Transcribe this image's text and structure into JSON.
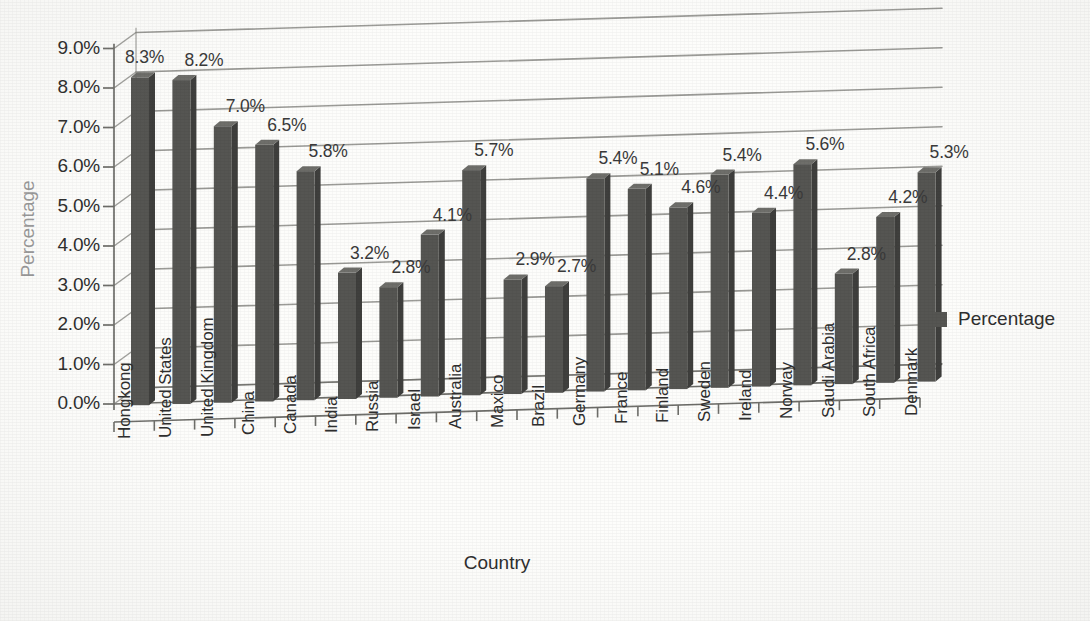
{
  "chart_data": {
    "type": "bar",
    "title": "",
    "xlabel": "Country",
    "ylabel": "Percentage",
    "ylim": [
      0,
      9
    ],
    "ytick_labels": [
      "0.0%",
      "1.0%",
      "2.0%",
      "3.0%",
      "4.0%",
      "5.0%",
      "6.0%",
      "7.0%",
      "8.0%",
      "9.0%"
    ],
    "ytick_values": [
      0,
      1,
      2,
      3,
      4,
      5,
      6,
      7,
      8,
      9
    ],
    "grid": true,
    "legend_position": "right",
    "legend": [
      "Percentage"
    ],
    "categories": [
      "Hongkong",
      "United States",
      "United Kingdom",
      "China",
      "Canada",
      "India",
      "Russia",
      "Israel",
      "Australia",
      "Maxico",
      "Brazil",
      "Germany",
      "France",
      "Finland",
      "Sweden",
      "Ireland",
      "Norway",
      "Saudi Arabia",
      "South Africa",
      "Denmark"
    ],
    "values": [
      8.3,
      8.2,
      7.0,
      6.5,
      5.8,
      3.2,
      2.8,
      4.1,
      5.7,
      2.9,
      2.7,
      5.4,
      5.1,
      4.6,
      5.4,
      4.4,
      5.6,
      2.8,
      4.2,
      5.3
    ],
    "data_labels": [
      "8.3%",
      "8.2%",
      "7.0%",
      "6.5%",
      "5.8%",
      "3.2%",
      "2.8%",
      "4.1%",
      "5.7%",
      "2.9%",
      "2.7%",
      "5.4%",
      "5.1%",
      "4.6%",
      "5.4%",
      "4.4%",
      "5.6%",
      "2.8%",
      "4.2%",
      "5.3%"
    ],
    "series": [
      {
        "name": "Percentage",
        "values": [
          8.3,
          8.2,
          7.0,
          6.5,
          5.8,
          3.2,
          2.8,
          4.1,
          5.7,
          2.9,
          2.7,
          5.4,
          5.1,
          4.6,
          5.4,
          4.4,
          5.6,
          2.8,
          4.2,
          5.3
        ]
      }
    ],
    "bar_color": "#555552",
    "bar_side_color": "#3f3f3d",
    "bar_top_color": "#6e6e6a",
    "gridline_color": "#8a8a86",
    "axis_color": "#6e6e6a"
  },
  "legend": {
    "swatch_color": "#555552",
    "label": "Percentage"
  },
  "axes": {
    "y_title": "Percentage",
    "x_title": "Country"
  }
}
